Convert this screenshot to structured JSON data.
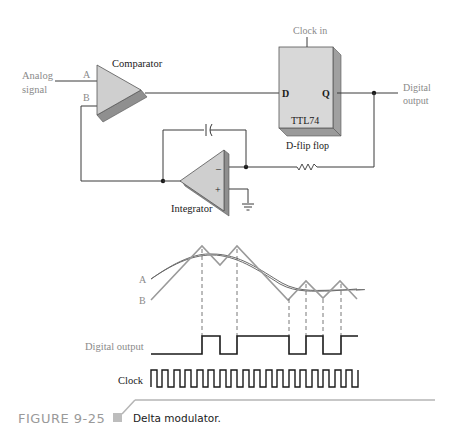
{
  "circuit": {
    "input_label_line1": "Analog",
    "input_label_line2": "signal",
    "comparator_label": "Comparator",
    "input_a": "A",
    "input_b": "B",
    "clock_in_label": "Clock in",
    "ff_d": "D",
    "ff_q": "Q",
    "ff_part": "TTL74",
    "ff_label": "D-flip flop",
    "output_label_line1": "Digital",
    "output_label_line2": "output",
    "integrator_label": "Integrator",
    "integrator_minus": "–",
    "integrator_plus": "+"
  },
  "waveforms": {
    "label_a": "A",
    "label_b": "B",
    "digital_output_label": "Digital output",
    "clock_label": "Clock",
    "clock_cycles": 17,
    "digital_output_sequence": [
      0,
      0,
      0,
      0,
      0,
      1,
      0,
      1,
      1,
      1,
      0,
      1,
      0,
      1,
      1,
      1,
      1
    ]
  },
  "caption": {
    "figure_number": "FIGURE 9-25",
    "text": "Delta modulator."
  },
  "colors": {
    "line": "#3a3a3a",
    "gray_label": "#8a8a8a",
    "opamp_fill": "#cfcfcf",
    "opamp_shadow": "#8f8f8f",
    "ff_fill": "#d8d8d8",
    "ff_side": "#a0a0a0",
    "waveform_gray": "#9a9a9a",
    "caption_gray": "#9a9a9a"
  }
}
